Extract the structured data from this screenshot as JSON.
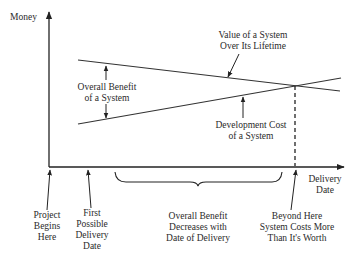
{
  "diagram": {
    "y_axis_label": "Money",
    "x_axis_label": "Delivery\nDate",
    "curves": {
      "value": {
        "label": "Value of a System\nOver Its Lifetime",
        "trend": "decreasing"
      },
      "cost": {
        "label": "Development Cost\nof a System",
        "trend": "increasing"
      }
    },
    "gap_label": "Overall Benefit\nof a System",
    "annotations": {
      "project_begins": "Project\nBegins\nHere",
      "first_delivery": "First\nPossible\nDelivery\nDate",
      "benefit_decreases": "Overall Benefit\nDecreases with\nDate of Delivery",
      "beyond_here": "Beyond Here\nSystem Costs More\nThan It's Worth"
    },
    "colors": {
      "line": "#333333",
      "background": "#ffffff"
    }
  }
}
